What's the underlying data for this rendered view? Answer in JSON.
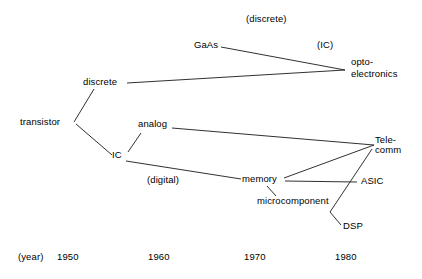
{
  "diagram": {
    "type": "tree",
    "title": "",
    "background_color": "#ffffff",
    "line_color": "#1a1a1a",
    "text_color": "#000000"
  },
  "nodes": [
    {
      "id": "transistor",
      "label": "transistor",
      "x": 20,
      "y": 125
    },
    {
      "id": "discrete",
      "label": "discrete",
      "x": 83,
      "y": 85
    },
    {
      "id": "ic",
      "label": "IC",
      "x": 112,
      "y": 158
    },
    {
      "id": "gaas",
      "label": "GaAs",
      "x": 194,
      "y": 48
    },
    {
      "id": "opto_line1",
      "label": "opto-",
      "x": 351,
      "y": 65
    },
    {
      "id": "opto_line2",
      "label": "electronics",
      "x": 351,
      "y": 77
    },
    {
      "id": "analog",
      "label": "analog",
      "x": 138,
      "y": 127
    },
    {
      "id": "memory",
      "label": "memory",
      "x": 242,
      "y": 182
    },
    {
      "id": "microcomponent",
      "label": "microcomponent",
      "x": 257,
      "y": 204
    },
    {
      "id": "telecomm_line1",
      "label": "Tele-",
      "x": 375,
      "y": 143
    },
    {
      "id": "telecomm_line2",
      "label": "comm",
      "x": 375,
      "y": 153
    },
    {
      "id": "asic",
      "label": "ASIC",
      "x": 361,
      "y": 184
    },
    {
      "id": "dsp",
      "label": "DSP",
      "x": 343,
      "y": 229
    }
  ],
  "annotations": [
    {
      "id": "annot_discrete",
      "label": "(discrete)",
      "x": 246,
      "y": 22
    },
    {
      "id": "annot_ic",
      "label": "(IC)",
      "x": 317,
      "y": 48
    },
    {
      "id": "annot_digital",
      "label": "(digital)",
      "x": 147,
      "y": 183
    }
  ],
  "axis": {
    "caption": "(year)",
    "caption_x": 18,
    "caption_y": 260,
    "ticks": [
      {
        "label": "1950",
        "x": 57
      },
      {
        "label": "1960",
        "x": 148
      },
      {
        "label": "1970",
        "x": 244
      },
      {
        "label": "1980",
        "x": 335
      }
    ],
    "tick_y": 260
  },
  "edges": [
    {
      "id": "transistor-discrete",
      "from": "transistor",
      "to": "discrete",
      "x1": 74,
      "y1": 122,
      "x2": 94,
      "y2": 89
    },
    {
      "id": "transistor-ic",
      "from": "transistor",
      "to": "ic",
      "x1": 76,
      "y1": 124,
      "x2": 112,
      "y2": 155
    },
    {
      "id": "discrete-opto",
      "from": "discrete",
      "to": "opto",
      "x1": 127,
      "y1": 83,
      "x2": 345,
      "y2": 70
    },
    {
      "id": "gaas-opto",
      "from": "gaas",
      "to": "opto",
      "x1": 221,
      "y1": 47,
      "x2": 345,
      "y2": 70
    },
    {
      "id": "ic-analog",
      "from": "ic",
      "to": "analog",
      "x1": 128,
      "y1": 152,
      "x2": 141,
      "y2": 133
    },
    {
      "id": "analog-telecomm",
      "from": "analog",
      "to": "telecomm",
      "x1": 172,
      "y1": 128,
      "x2": 374,
      "y2": 145
    },
    {
      "id": "ic-memory",
      "from": "ic",
      "to": "memory",
      "x1": 126,
      "y1": 161,
      "x2": 241,
      "y2": 179
    },
    {
      "id": "memory-telecomm",
      "from": "memory",
      "to": "telecomm",
      "x1": 284,
      "y1": 178,
      "x2": 374,
      "y2": 145
    },
    {
      "id": "memory-asic",
      "from": "memory",
      "to": "asic",
      "x1": 285,
      "y1": 181,
      "x2": 357,
      "y2": 182
    },
    {
      "id": "memory-microcomponent",
      "from": "memory",
      "to": "microcomponent",
      "x1": 267,
      "y1": 186,
      "x2": 276,
      "y2": 196
    },
    {
      "id": "telecomm-dsp",
      "from": "telecomm",
      "to": "dsp",
      "x1": 372,
      "y1": 149,
      "x2": 330,
      "y2": 212
    },
    {
      "id": "dsp-stub",
      "from": "microcomponent",
      "to": "dsp",
      "x1": 330,
      "y1": 212,
      "x2": 341,
      "y2": 225
    }
  ]
}
